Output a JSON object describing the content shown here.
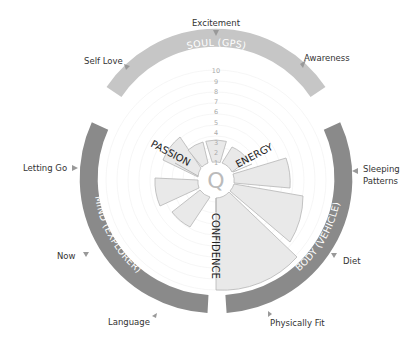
{
  "diagram": {
    "center_label": "Q",
    "colors": {
      "soul_arc": "#c6c6c6",
      "mind_arc": "#8a8a8a",
      "body_arc": "#8a8a8a",
      "segment_fill": "#e9e9e9",
      "segment_stroke": "#b5b5b5",
      "marker": "#999999"
    },
    "rings": [
      {
        "id": "soul",
        "label": "SOUL (GPS)"
      },
      {
        "id": "mind",
        "label": "MIND (EXPLORER)"
      },
      {
        "id": "body",
        "label": "BODY (VEHICLE)"
      }
    ],
    "axes": {
      "passion": "PASSION",
      "energy": "ENERGY",
      "confidence": "CONFIDENCE"
    },
    "scale": [
      "1",
      "2",
      "3",
      "4",
      "5",
      "6",
      "7",
      "8",
      "9",
      "10"
    ],
    "outer_labels": {
      "excitement": "Excitement",
      "self_love": "Self Love",
      "awareness": "Awareness",
      "letting_go": "Letting Go",
      "sleeping_patterns_1": "Sleeping",
      "sleeping_patterns_2": "Patterns",
      "now": "Now",
      "diet": "Diet",
      "language": "Language",
      "physically_fit": "Physically Fit"
    }
  }
}
